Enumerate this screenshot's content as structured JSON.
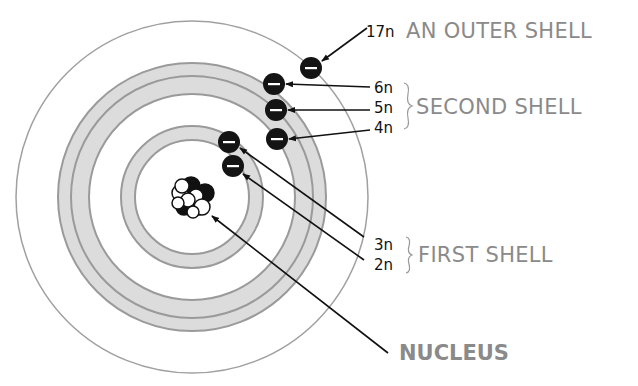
{
  "diagram": {
    "labels": {
      "outer_shell": "AN OUTER SHELL",
      "second_shell": "SECOND SHELL",
      "first_shell": "FIRST SHELL",
      "nucleus": "NUCLEUS"
    },
    "electrons": [
      {
        "id": "e17",
        "label": "17n",
        "shell": "outer",
        "symbol": "−"
      },
      {
        "id": "e6",
        "label": "6n",
        "shell": "second",
        "symbol": "−"
      },
      {
        "id": "e5",
        "label": "5n",
        "shell": "second",
        "symbol": "−"
      },
      {
        "id": "e4",
        "label": "4n",
        "shell": "second",
        "symbol": "−"
      },
      {
        "id": "e3",
        "label": "3n",
        "shell": "first",
        "symbol": "−"
      },
      {
        "id": "e2",
        "label": "2n",
        "shell": "first",
        "symbol": "−"
      }
    ],
    "colors": {
      "ring_fill": "#dcdcdc",
      "ring_stroke": "#9a9a9a",
      "electron": "#141414",
      "label_gray": "#8a8a8a",
      "label_dark": "#111111"
    }
  }
}
